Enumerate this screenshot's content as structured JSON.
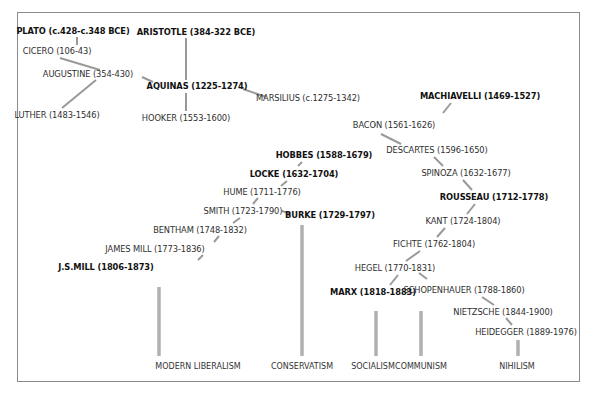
{
  "diagram": {
    "title": "",
    "colors": {
      "link": "#999999",
      "trunk": "#b0b0b0",
      "frame": "#8a8a8a",
      "text": "#2f2f2f"
    },
    "thinkers": [
      {
        "id": "plato",
        "label": "PLATO (c.428-c.348 BCE)",
        "bold": true
      },
      {
        "id": "cicero",
        "label": "CICERO (106-43)",
        "bold": false
      },
      {
        "id": "augustine",
        "label": "AUGUSTINE (354-430)",
        "bold": false
      },
      {
        "id": "luther",
        "label": "LUTHER (1483-1546)",
        "bold": false
      },
      {
        "id": "aristotle",
        "label": "ARISTOTLE (384-322 BCE)",
        "bold": true
      },
      {
        "id": "aquinas",
        "label": "AQUINAS (1225-1274)",
        "bold": true
      },
      {
        "id": "hooker",
        "label": "HOOKER (1553-1600)",
        "bold": false
      },
      {
        "id": "marsilius",
        "label": "MARSILIUS (c.1275-1342)",
        "bold": false
      },
      {
        "id": "machiavelli",
        "label": "MACHIAVELLI (1469-1527)",
        "bold": true
      },
      {
        "id": "bacon",
        "label": "BACON (1561-1626)",
        "bold": false
      },
      {
        "id": "descartes",
        "label": "DESCARTES (1596-1650)",
        "bold": false
      },
      {
        "id": "spinoza",
        "label": "SPINOZA (1632-1677)",
        "bold": false
      },
      {
        "id": "rousseau",
        "label": "ROUSSEAU (1712-1778)",
        "bold": true
      },
      {
        "id": "kant",
        "label": "KANT (1724-1804)",
        "bold": false
      },
      {
        "id": "fichte",
        "label": "FICHTE (1762-1804)",
        "bold": false
      },
      {
        "id": "hegel",
        "label": "HEGEL (1770-1831)",
        "bold": false
      },
      {
        "id": "marx",
        "label": "MARX (1818-1883)",
        "bold": true
      },
      {
        "id": "schopenhauer",
        "label": "SCHOPENHAUER (1788-1860)",
        "bold": false
      },
      {
        "id": "nietzsche",
        "label": "NIETZSCHE (1844-1900)",
        "bold": false
      },
      {
        "id": "heidegger",
        "label": "HEIDEGGER (1889-1976)",
        "bold": false
      },
      {
        "id": "hobbes",
        "label": "HOBBES (1588-1679)",
        "bold": true
      },
      {
        "id": "locke",
        "label": "LOCKE (1632-1704)",
        "bold": true
      },
      {
        "id": "hume",
        "label": "HUME (1711-1776)",
        "bold": false
      },
      {
        "id": "smith",
        "label": "SMITH (1723-1790)",
        "bold": false
      },
      {
        "id": "burke",
        "label": "BURKE (1729-1797)",
        "bold": true
      },
      {
        "id": "bentham",
        "label": "BENTHAM (1748-1832)",
        "bold": false
      },
      {
        "id": "jamesmill",
        "label": "JAMES MILL (1773-1836)",
        "bold": false
      },
      {
        "id": "jsmill",
        "label": "J.S.MILL (1806-1873)",
        "bold": true
      }
    ],
    "links": [
      [
        "plato",
        "cicero"
      ],
      [
        "cicero",
        "augustine"
      ],
      [
        "augustine",
        "luther"
      ],
      [
        "augustine",
        "aquinas"
      ],
      [
        "aristotle",
        "aquinas"
      ],
      [
        "aquinas",
        "hooker"
      ],
      [
        "aquinas",
        "marsilius"
      ],
      [
        "machiavelli",
        "bacon"
      ],
      [
        "bacon",
        "descartes"
      ],
      [
        "descartes",
        "spinoza"
      ],
      [
        "spinoza",
        "rousseau"
      ],
      [
        "rousseau",
        "kant"
      ],
      [
        "kant",
        "fichte"
      ],
      [
        "fichte",
        "hegel"
      ],
      [
        "hegel",
        "marx"
      ],
      [
        "hegel",
        "schopenhauer"
      ],
      [
        "schopenhauer",
        "nietzsche"
      ],
      [
        "nietzsche",
        "heidegger"
      ],
      [
        "hobbes",
        "locke"
      ],
      [
        "locke",
        "hume"
      ],
      [
        "hume",
        "smith"
      ],
      [
        "smith",
        "burke"
      ],
      [
        "smith",
        "bentham"
      ],
      [
        "bentham",
        "jamesmill"
      ],
      [
        "jamesmill",
        "jsmill"
      ]
    ],
    "outcomes": [
      {
        "id": "modern-liberalism",
        "label": "MODERN LIBERALISM",
        "from": "jsmill"
      },
      {
        "id": "conservatism",
        "label": "CONSERVATISM",
        "from": "burke"
      },
      {
        "id": "socialism",
        "label": "SOCIALISM",
        "from": "marx"
      },
      {
        "id": "communism",
        "label": "COMMUNISM",
        "from": "marx"
      },
      {
        "id": "nihilism",
        "label": "NIHILISM",
        "from": "heidegger"
      }
    ]
  }
}
